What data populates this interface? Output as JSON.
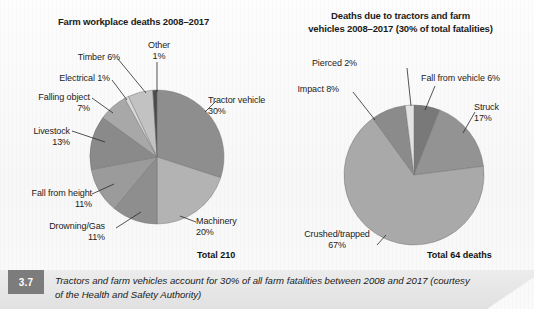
{
  "figure": {
    "caption_number": "3.7",
    "caption_text": "Tractors and farm vehicles account for 30% of all farm fatalities between 2008 and 2017 (courtesy of the Health and Safety Authority)"
  },
  "chart_data": [
    {
      "type": "pie",
      "id": "farm-workplace-deaths",
      "title": "Farm workplace deaths 2008–2017",
      "total_label": "Total 210",
      "total_value": 210,
      "start_angle": 0,
      "direction": "clockwise",
      "categories": [
        "Tractor vehicle",
        "Machinery",
        "Drowning/Gas",
        "Fall from height",
        "Livestock",
        "Falling object",
        "Electrical",
        "Timber",
        "Other"
      ],
      "values": [
        30,
        20,
        11,
        11,
        13,
        7,
        1,
        6,
        1
      ],
      "value_unit": "%",
      "labels": [
        {
          "name": "Tractor vehicle",
          "value": "30%",
          "text": "Tractor vehicle\n30%"
        },
        {
          "name": "Machinery",
          "value": "20%",
          "text": "Machinery\n20%"
        },
        {
          "name": "Drowning/Gas",
          "value": "11%",
          "text": "Drowning/Gas\n11%"
        },
        {
          "name": "Fall from height",
          "value": "11%",
          "text": "Fall from height\n11%"
        },
        {
          "name": "Livestock",
          "value": "13%",
          "text": "Livestock\n13%"
        },
        {
          "name": "Falling object",
          "value": "7%",
          "text": "Falling object\n7%"
        },
        {
          "name": "Electrical",
          "value": "1%",
          "text": "Electrical 1%"
        },
        {
          "name": "Timber",
          "value": "6%",
          "text": "Timber 6%"
        },
        {
          "name": "Other",
          "value": "1%",
          "text": "Other\n1%"
        }
      ],
      "slice_colors": [
        "#8e8e8e",
        "#b3b3b3",
        "#8e8e8e",
        "#9b9b9b",
        "#8a8a8a",
        "#a8a8a8",
        "#d8d8d8",
        "#c2c2c2",
        "#4a4a4a"
      ],
      "legend": "none",
      "grid": false
    },
    {
      "type": "pie",
      "id": "tractor-farm-vehicle-deaths",
      "title": "Deaths due to tractors and farm vehicles 2008–2017 (30% of total fatalities)",
      "title_line1": "Deaths due to tractors and farm",
      "title_line2": "vehicles 2008–2017 (30% of total fatalities)",
      "total_label": "Total 64 deaths",
      "total_value": 64,
      "start_angle": 0,
      "direction": "clockwise",
      "categories": [
        "Fall from vehicle",
        "Struck",
        "Crushed/trapped",
        "Impact",
        "Pierced"
      ],
      "values": [
        6,
        17,
        67,
        8,
        2
      ],
      "value_unit": "%",
      "labels": [
        {
          "name": "Fall from vehicle",
          "value": "6%",
          "text": "Fall from vehicle 6%"
        },
        {
          "name": "Struck",
          "value": "17%",
          "text": "Struck\n17%"
        },
        {
          "name": "Crushed/trapped",
          "value": "67%",
          "text": "Crushed/trapped\n67%"
        },
        {
          "name": "Impact",
          "value": "8%",
          "text": "Impact 8%"
        },
        {
          "name": "Pierced",
          "value": "2%",
          "text": "Pierced 2%"
        }
      ],
      "slice_colors": [
        "#797979",
        "#939393",
        "#a9a9a9",
        "#8b8b8b",
        "#e2e2e2"
      ],
      "legend": "none",
      "grid": false
    }
  ]
}
